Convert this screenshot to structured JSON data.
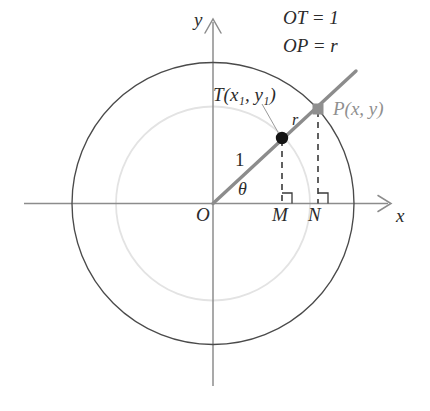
{
  "figure": {
    "type": "geometry-diagram",
    "title_annotations": {
      "ot_equals": "OT = 1",
      "op_equals": "OP = r"
    },
    "axes": {
      "x_label": "x",
      "y_label": "y",
      "origin_label": "O",
      "x_axis_color": "#8c8c8c",
      "y_axis_color": "#8c8c8c"
    },
    "circles": [
      {
        "name": "unit-circle-outer",
        "center": [
          213,
          203.5
        ],
        "radius": 141,
        "stroke": "#4a4a4a",
        "stroke_width": 1.3
      },
      {
        "name": "inner-circle",
        "center": [
          213,
          203.5
        ],
        "radius": 97,
        "stroke": "#e2e2e2",
        "stroke_width": 1.6
      }
    ],
    "ray": {
      "name": "terminal-ray",
      "from": [
        213,
        203.5
      ],
      "through": [
        355,
        72
      ],
      "stroke": "#8c8c8c",
      "stroke_width": 3.2
    },
    "points": [
      {
        "name": "point-t",
        "label": "T(x₁, y₁)",
        "label_plain": "T(x1, y1)",
        "coords": [
          282,
          138
        ],
        "marker": "filled-circle",
        "color": "#1a1a1a"
      },
      {
        "name": "point-p",
        "label": "P(x, y)",
        "coords": [
          318,
          109
        ],
        "marker": "filled-square",
        "color": "#8f8f8f"
      }
    ],
    "segments": [
      {
        "name": "segment-ot",
        "label": "1",
        "description": "length of OT"
      },
      {
        "name": "segment-tp",
        "label": "r",
        "description": "radius label near P"
      }
    ],
    "angle": {
      "name": "angle-theta",
      "label": "θ",
      "vertex": "O",
      "between": [
        "positive x-axis",
        "ray OP"
      ]
    },
    "feet": [
      {
        "name": "foot-m",
        "label": "M",
        "x": 282,
        "from_point": "T",
        "right_angle": true
      },
      {
        "name": "foot-n",
        "label": "N",
        "x": 318,
        "from_point": "P",
        "right_angle": true
      }
    ],
    "dashed_drop_lines": {
      "stroke": "#3a3a3a",
      "dash": "6 5",
      "stroke_width": 1.6
    }
  }
}
